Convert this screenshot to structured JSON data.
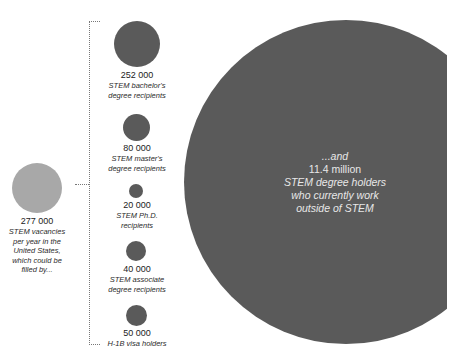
{
  "diagram": {
    "source": {
      "value": "277 000",
      "description": "STEM vacancies per year in the United States, which could be filled by...",
      "lines": [
        "STEM vacancies",
        "per year in the",
        "United States,",
        "which could be",
        "filled by..."
      ],
      "color": "#a8a8a8"
    },
    "pools": [
      {
        "value": "252 000",
        "lines": [
          "STEM bachelor's",
          "degree recipients"
        ],
        "color": "#5a5a5a"
      },
      {
        "value": "80 000",
        "lines": [
          "STEM master's",
          "degree recipients"
        ],
        "color": "#5a5a5a"
      },
      {
        "value": "20 000",
        "lines": [
          "STEM Ph.D.",
          "recipients"
        ],
        "color": "#5a5a5a"
      },
      {
        "value": "40 000",
        "lines": [
          "STEM associate",
          "degree recipients"
        ],
        "color": "#5a5a5a"
      },
      {
        "value": "50 000",
        "lines": [
          "H-1B visa holders"
        ],
        "color": "#5a5a5a"
      }
    ],
    "big": {
      "lead": "...and",
      "value": "11.4 million",
      "lines": [
        "STEM degree holders",
        "who currently work",
        "outside of STEM"
      ],
      "color": "#5a5a5a"
    }
  }
}
